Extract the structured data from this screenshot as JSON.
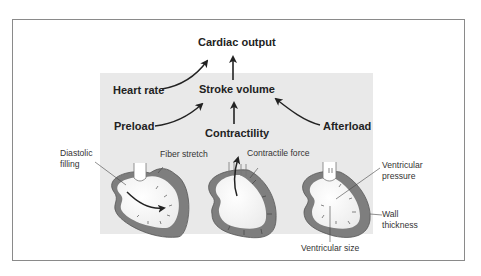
{
  "diagram": {
    "top_node": "Cardiac output",
    "middle_node": "Stroke volume",
    "heart_rate": "Heart rate",
    "preload": "Preload",
    "contractility": "Contractility",
    "afterload": "Afterload",
    "heart_labels": {
      "diastolic_filling_line1": "Diastolic",
      "diastolic_filling_line2": "filling",
      "fiber_stretch": "Fiber stretch",
      "contractile_force": "Contractile force",
      "ventricular_pressure_line1": "Ventricular",
      "ventricular_pressure_line2": "pressure",
      "wall_thickness_line1": "Wall",
      "wall_thickness_line2": "thickness",
      "ventricular_size": "Ventricular size"
    },
    "colors": {
      "frame": "#8a8a8a",
      "panel": "#e9e9e9",
      "heart_wall": "#7a7a7a",
      "heart_inner": "#ffffff",
      "arrow": "#222222"
    }
  }
}
